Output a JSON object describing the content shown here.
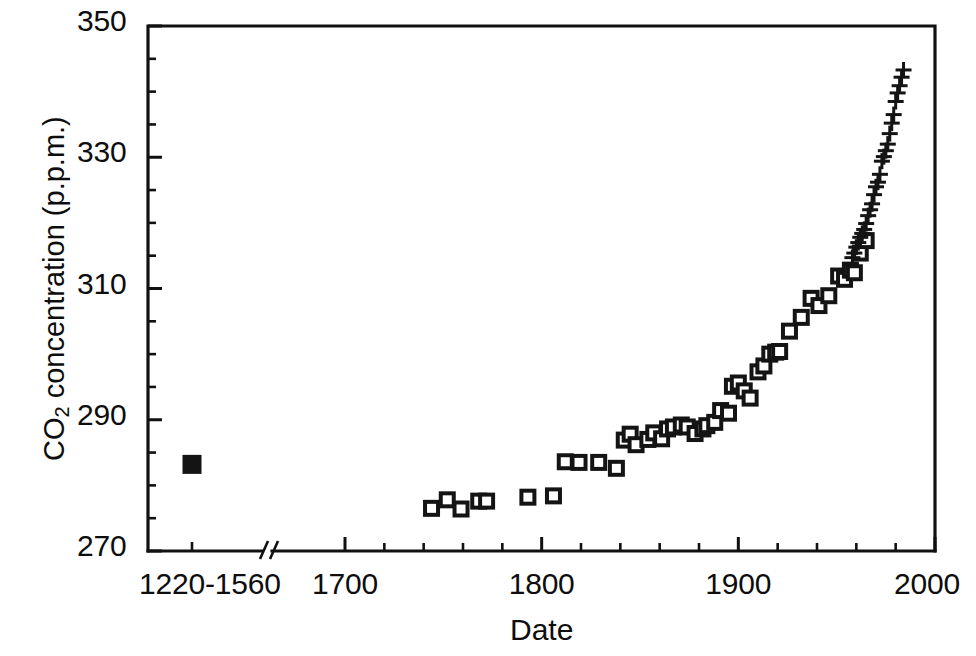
{
  "chart_data": {
    "type": "scatter",
    "title": "",
    "xlabel": "Date",
    "ylabel": "CO2 concentration (p.p.m.)",
    "ylabel_parts": {
      "prefix": "CO",
      "subscript": "2",
      "suffix": " concentration (p.p.m.)"
    },
    "xlim": [
      1680,
      2000
    ],
    "ylim": [
      270,
      350
    ],
    "grid": false,
    "legend": "none",
    "axis_break": {
      "present": true,
      "label_left_of_break": "1220-1560",
      "note": "x-axis is broken between the 1220-1560 pooled sample and 1700"
    },
    "y_ticks_major": [
      270,
      290,
      310,
      330,
      350
    ],
    "y_ticks_minor_step": 5,
    "x_ticks_major": [
      1700,
      1800,
      1900,
      2000
    ],
    "x_ticks_major_labels": [
      "1700",
      "1800",
      "1900",
      "2000"
    ],
    "x_tick_label_break": "1220-1560",
    "x_ticks_minor_step": 20,
    "series": [
      {
        "name": "ice-core pooled sample (1220-1560)",
        "marker": "filled-square",
        "points": [
          [
            1240,
            283.2
          ]
        ]
      },
      {
        "name": "ice-core air bubbles",
        "marker": "open-square",
        "x": [
          1744,
          1752,
          1759,
          1768,
          1772,
          1793,
          1806,
          1812,
          1819,
          1829,
          1838,
          1842,
          1845,
          1848,
          1854,
          1857,
          1861,
          1864,
          1867,
          1871,
          1874,
          1878,
          1882,
          1884,
          1888,
          1891,
          1895,
          1897,
          1900,
          1903,
          1906,
          1910,
          1913,
          1916,
          1919,
          1921,
          1926,
          1932,
          1937,
          1941,
          1946,
          1951,
          1954,
          1957,
          1959,
          1962,
          1965
        ],
        "y": [
          276.5,
          277.8,
          276.4,
          277.6,
          277.6,
          278.2,
          278.4,
          283.6,
          283.5,
          283.5,
          282.6,
          286.9,
          287.8,
          286.2,
          287.0,
          288.0,
          287.1,
          288.6,
          288.9,
          289.2,
          288.9,
          287.9,
          288.6,
          289.1,
          289.6,
          291.4,
          291.0,
          295.1,
          295.6,
          294.4,
          293.3,
          297.3,
          298.2,
          300.0,
          300.3,
          300.4,
          303.5,
          305.6,
          308.5,
          307.4,
          308.9,
          311.9,
          311.4,
          312.8,
          312.4,
          315.4,
          317.3
        ]
      },
      {
        "name": "Mauna Loa atmospheric record",
        "marker": "plus",
        "x": [
          1958,
          1959,
          1960,
          1961,
          1962,
          1963,
          1964,
          1965,
          1966,
          1967,
          1968,
          1969,
          1970,
          1971,
          1972,
          1973,
          1974,
          1975,
          1976,
          1977,
          1978,
          1979,
          1980,
          1981,
          1982,
          1983,
          1984
        ],
        "y": [
          314.7,
          315.4,
          316.3,
          317.0,
          317.8,
          318.4,
          319.0,
          319.9,
          321.1,
          322.0,
          322.9,
          324.3,
          325.5,
          326.2,
          327.4,
          329.4,
          330.1,
          331.0,
          332.0,
          333.6,
          335.2,
          336.5,
          338.5,
          339.8,
          340.9,
          342.2,
          343.3
        ]
      }
    ]
  },
  "axis_labels": {
    "y_tick_350": "350",
    "y_tick_330": "330",
    "y_tick_310": "310",
    "y_tick_290": "290",
    "y_tick_270": "270",
    "x_tick_break": "1220-1560",
    "x_tick_1700": "1700",
    "x_tick_1800": "1800",
    "x_tick_1900": "1900",
    "x_tick_2000": "2000",
    "x_axis_title": "Date",
    "y_axis_title_prefix": "CO",
    "y_axis_title_sub": "2",
    "y_axis_title_suffix": " concentration (p.p.m.)"
  },
  "colors": {
    "ink": "#111111",
    "background": "#ffffff",
    "marker": "#141414"
  }
}
